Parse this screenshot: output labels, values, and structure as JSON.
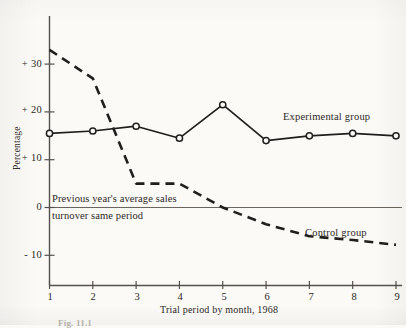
{
  "figure": {
    "caption": "Fig. 11.1",
    "y_axis_title": "Percentage",
    "x_axis_title": "Trial period by month, 1968",
    "note_line_1": "Previous year's average sales",
    "note_line_2": "turnover same period",
    "experimental_label": "Experimental group",
    "control_label": "Control group",
    "ink_color": "#211f1d",
    "axis_color": "#55514c"
  },
  "chart_data": {
    "type": "line",
    "title": "",
    "subtitle": "",
    "xlabel": "Trial period by month, 1968",
    "ylabel": "Percentage",
    "x": [
      1,
      2,
      3,
      4,
      5,
      6,
      7,
      8,
      9
    ],
    "xticklabels": [
      "1",
      "2",
      "3",
      "4",
      "5",
      "6",
      "7",
      "8",
      "9"
    ],
    "yticklabels": [
      "+ 30",
      "+ 20",
      "+ 10",
      "0",
      "- 10"
    ],
    "ytickvalues": [
      30,
      20,
      10,
      0,
      -10
    ],
    "xlim": [
      1,
      9
    ],
    "ylim": [
      -14,
      36
    ],
    "grid": false,
    "legend": "inline-annotations",
    "zero_reference_line": 0,
    "series": [
      {
        "name": "Experimental group",
        "style": "solid",
        "marker": "open-circle",
        "values": [
          15.5,
          16,
          17,
          14.5,
          21.5,
          14,
          15,
          15.5,
          15
        ]
      },
      {
        "name": "Control group",
        "style": "dashed",
        "marker": "none",
        "values": [
          33,
          27,
          5,
          5,
          0,
          -3.5,
          -6,
          -6.8,
          -7.8
        ]
      }
    ],
    "annotations": [
      {
        "text": "Previous year's average sales turnover same period",
        "at_y": 0,
        "placement": "straddles-zero-line"
      }
    ]
  }
}
